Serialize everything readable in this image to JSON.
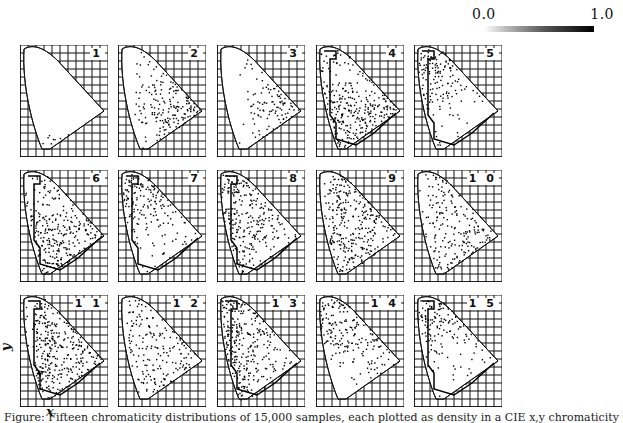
{
  "colorbar": {
    "min_label": "0.0",
    "max_label": "1.0"
  },
  "axes": {
    "x_label": "x",
    "y_label": "y"
  },
  "caption": "Figure: Fifteen chromaticity distributions of 15,000 samples, each plotted as density in a CIE x,y chromaticity diagram with contours",
  "panels": [
    {
      "label": "1",
      "row": 0,
      "col": 0,
      "density": "sparse-bottom"
    },
    {
      "label": "2",
      "row": 0,
      "col": 1,
      "density": "right-dark"
    },
    {
      "label": "3",
      "row": 0,
      "col": 2,
      "density": "right-medium"
    },
    {
      "label": "4",
      "row": 0,
      "col": 3,
      "density": "center-dark-contour"
    },
    {
      "label": "5",
      "row": 0,
      "col": 4,
      "density": "top-left-dark"
    },
    {
      "label": "6",
      "row": 1,
      "col": 0,
      "density": "center-dark-contour"
    },
    {
      "label": "7",
      "row": 1,
      "col": 1,
      "density": "top-left-dark"
    },
    {
      "label": "8",
      "row": 1,
      "col": 2,
      "density": "left-dark-contour"
    },
    {
      "label": "9",
      "row": 1,
      "col": 3,
      "density": "uniform-dark"
    },
    {
      "label": "1 0",
      "row": 1,
      "col": 4,
      "density": "uniform-medium"
    },
    {
      "label": "1 1",
      "row": 2,
      "col": 0,
      "density": "uniform-dark-contour"
    },
    {
      "label": "1 2",
      "row": 2,
      "col": 1,
      "density": "uniform-medium"
    },
    {
      "label": "1 3",
      "row": 2,
      "col": 2,
      "density": "left-dark-contour"
    },
    {
      "label": "1 4",
      "row": 2,
      "col": 3,
      "density": "top-dark"
    },
    {
      "label": "1 5",
      "row": 2,
      "col": 4,
      "density": "top-left-dark"
    }
  ],
  "layout": {
    "col_x": [
      20,
      118,
      217,
      316,
      414
    ],
    "row_y": [
      45,
      170,
      295
    ]
  }
}
